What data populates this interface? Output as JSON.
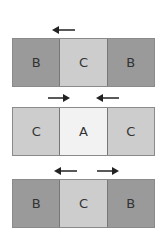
{
  "colors": {
    "A": "#f2f2f2",
    "B": "#9a9a9a",
    "C": "#cdcdcd",
    "arrow": "#222222"
  },
  "rows": [
    {
      "cells": [
        "B",
        "C",
        "B"
      ],
      "arrows": [
        {
          "direction": "left"
        }
      ]
    },
    {
      "cells": [
        "C",
        "A",
        "C"
      ],
      "arrows": [
        {
          "direction": "right"
        },
        {
          "direction": "left"
        }
      ]
    },
    {
      "cells": [
        "B",
        "C",
        "B"
      ],
      "arrows": [
        {
          "direction": "left"
        },
        {
          "direction": "right"
        }
      ]
    }
  ]
}
